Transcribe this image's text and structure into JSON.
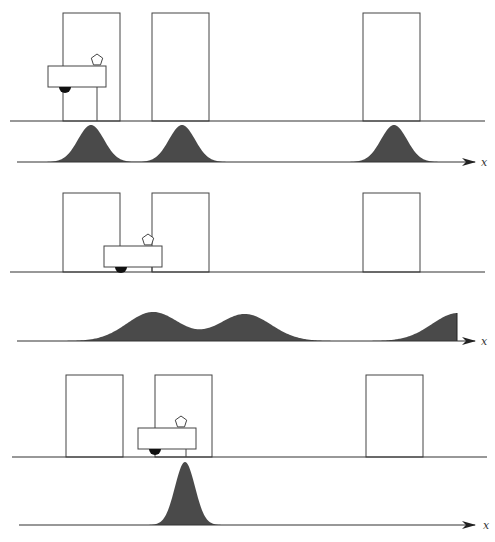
{
  "figure": {
    "axis_label": "x",
    "colors": {
      "line": "#333333",
      "door_stroke": "#444444",
      "belief_fill": "#4a4a4a",
      "wheel": "#111111"
    }
  },
  "panels": [
    {
      "id": "scene-1",
      "type": "scene",
      "floor_y": 121,
      "floor_x": [
        10,
        485
      ],
      "doors": [
        {
          "x": 63,
          "w": 57,
          "top": 13
        },
        {
          "x": 152,
          "w": 57,
          "top": 13
        },
        {
          "x": 363,
          "w": 57,
          "top": 13
        }
      ],
      "robot": {
        "x": 48,
        "y": 66,
        "w": 58,
        "h": 21,
        "wheel_cx": 65,
        "sensor_x": 97,
        "leg_x": 97
      }
    },
    {
      "id": "belief-1",
      "type": "belief",
      "axis_y": 162,
      "axis_x": [
        17,
        475
      ],
      "label_x": 481,
      "peaks": [
        {
          "mu": 91,
          "sigma": 13,
          "height": 37
        },
        {
          "mu": 182,
          "sigma": 13,
          "height": 37
        },
        {
          "mu": 394,
          "sigma": 13,
          "height": 37
        }
      ]
    },
    {
      "id": "scene-2",
      "type": "scene",
      "floor_y": 272,
      "floor_x": [
        10,
        485
      ],
      "doors": [
        {
          "x": 63,
          "w": 57,
          "top": 193
        },
        {
          "x": 152,
          "w": 57,
          "top": 193
        },
        {
          "x": 363,
          "w": 57,
          "top": 193
        }
      ],
      "robot": {
        "x": 104,
        "y": 246,
        "w": 58,
        "h": 21,
        "wheel_cx": 121,
        "sensor_x": 148,
        "leg_x": 152
      }
    },
    {
      "id": "belief-2",
      "type": "belief",
      "axis_y": 341,
      "axis_x": [
        17,
        475
      ],
      "label_x": 481,
      "peaks": [
        {
          "mu": 153,
          "sigma": 26,
          "height": 29
        },
        {
          "mu": 245,
          "sigma": 26,
          "height": 27
        },
        {
          "mu": 458,
          "sigma": 26,
          "height": 28
        }
      ],
      "clip_right": 457
    },
    {
      "id": "scene-3",
      "type": "scene",
      "floor_y": 457,
      "floor_x": [
        12,
        487
      ],
      "doors": [
        {
          "x": 66,
          "w": 57,
          "top": 375
        },
        {
          "x": 155,
          "w": 57,
          "top": 375
        },
        {
          "x": 366,
          "w": 57,
          "top": 375
        }
      ],
      "robot": {
        "x": 138,
        "y": 428,
        "w": 58,
        "h": 21,
        "wheel_cx": 155,
        "sensor_x": 181,
        "leg_x": 186
      }
    },
    {
      "id": "belief-3",
      "type": "belief",
      "axis_y": 525,
      "axis_x": [
        19,
        475
      ],
      "label_x": 483,
      "peaks": [
        {
          "mu": 185,
          "sigma": 10,
          "height": 63
        }
      ]
    }
  ]
}
